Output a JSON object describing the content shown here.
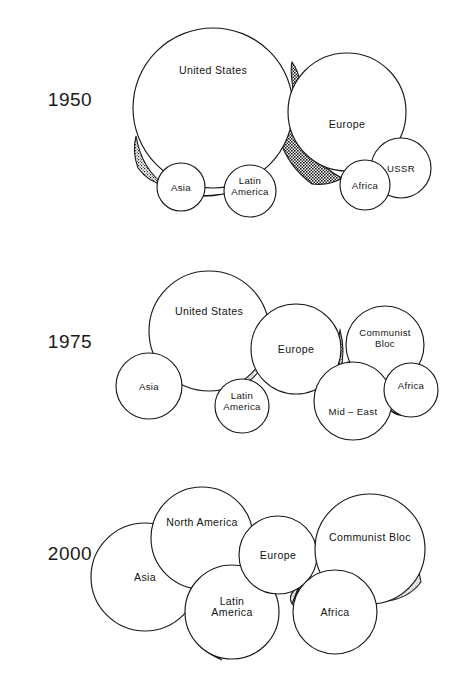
{
  "figure": {
    "background_color": "#ffffff",
    "line_color": "#1a1a1a",
    "shade_color": "#2b2b2b",
    "width": 470,
    "height": 683
  },
  "chart_data": {
    "type": "bubble",
    "xlabel": "",
    "ylabel": "",
    "legend_position": "none",
    "grid": false,
    "note": "Each panel is a year; circle area represents relative share of world power. Stippled lenses mark the gaps/overlaps between adjacent blocs.",
    "panels": [
      {
        "year": "1950",
        "year_x": 70,
        "year_y": 106,
        "bubbles": [
          {
            "label": "United States",
            "cx": 213,
            "cy": 108,
            "r": 80,
            "label_dy": -34,
            "size_class": "big"
          },
          {
            "label": "Europe",
            "cx": 347,
            "cy": 112,
            "r": 59,
            "label_dy": 16,
            "size_class": "big"
          },
          {
            "label": "USSR",
            "cx": 401,
            "cy": 168,
            "r": 30,
            "label_dy": 4,
            "size_class": "small"
          },
          {
            "label": "Asia",
            "cx": 181,
            "cy": 187,
            "r": 24,
            "label_dy": 4,
            "size_class": "small"
          },
          {
            "label": "Latin\nAmerica",
            "cx": 250,
            "cy": 191,
            "r": 26,
            "label_dy": -2,
            "size_class": "small"
          },
          {
            "label": "Africa",
            "cx": 365,
            "cy": 185,
            "r": 25,
            "label_dy": 4,
            "size_class": "small"
          }
        ],
        "shades": [
          {
            "tone": "dark",
            "path": "M 292 62 Q 306 82 297 108 Q 289 74 292 62 Z"
          },
          {
            "tone": "dark",
            "path": "M 296 118 Q 306 160 342 178 Q 330 186 312 184 Q 288 166 280 140 Q 290 128 296 118 Z"
          },
          {
            "tone": "medium",
            "path": "M 136 136 Q 142 170 166 186 Q 148 182 138 168 Q 132 152 136 136 Z"
          },
          {
            "tone": "medium",
            "path": "M 166 190 Q 196 200 224 194 Q 196 198 172 193 Z"
          },
          {
            "tone": "medium",
            "path": "M 374 176 Q 388 186 392 196 Q 380 192 373 182 Z"
          }
        ]
      },
      {
        "year": "1975",
        "year_x": 70,
        "year_y": 348,
        "bubbles": [
          {
            "label": "United States",
            "cx": 209,
            "cy": 331,
            "r": 60,
            "label_dy": -16,
            "size_class": "big"
          },
          {
            "label": "Europe",
            "cx": 296,
            "cy": 349,
            "r": 45,
            "label_dy": 4,
            "size_class": "big"
          },
          {
            "label": "Communist\nBloc",
            "cx": 385,
            "cy": 345,
            "r": 39,
            "label_dy": -4,
            "size_class": "small"
          },
          {
            "label": "Asia",
            "cx": 149,
            "cy": 386,
            "r": 33,
            "label_dy": 4,
            "size_class": "small"
          },
          {
            "label": "Latin\nAmerica",
            "cx": 242,
            "cy": 406,
            "r": 27,
            "label_dy": -2,
            "size_class": "small"
          },
          {
            "label": "Mid – East",
            "cx": 353,
            "cy": 401,
            "r": 39,
            "label_dy": 14,
            "size_class": "small"
          },
          {
            "label": "Africa",
            "cx": 411,
            "cy": 390,
            "r": 27,
            "label_dy": -1,
            "size_class": "small"
          }
        ],
        "shades": [
          {
            "tone": "medium",
            "path": "M 181 378 Q 210 392 238 384 Q 212 396 186 386 Z"
          },
          {
            "tone": "light",
            "path": "M 258 372 Q 248 386 240 380 Q 252 372 258 366 Z"
          },
          {
            "tone": "light",
            "path": "M 253 316 Q 262 340 258 366 Q 250 342 253 316 Z"
          },
          {
            "tone": "medium",
            "path": "M 340 330 Q 346 352 340 372 Q 335 350 340 330 Z"
          },
          {
            "tone": "medium",
            "path": "M 348 362 Q 368 376 386 374 Q 362 382 346 370 Z"
          },
          {
            "tone": "medium",
            "path": "M 419 362 Q 409 374 390 374 Q 408 368 419 358 Z"
          },
          {
            "tone": "medium",
            "path": "M 388 408 Q 398 418 404 414 Q 392 414 386 406 Z"
          }
        ]
      },
      {
        "year": "2000",
        "year_x": 70,
        "year_y": 560,
        "bubbles": [
          {
            "label": "Asia",
            "cx": 145,
            "cy": 577,
            "r": 54,
            "label_dy": 4,
            "size_class": "big"
          },
          {
            "label": "North America",
            "cx": 202,
            "cy": 538,
            "r": 51,
            "label_dy": -12,
            "size_class": "big"
          },
          {
            "label": "Latin\nAmerica",
            "cx": 232,
            "cy": 612,
            "r": 47,
            "label_dy": -2,
            "size_class": "big"
          },
          {
            "label": "Europe",
            "cx": 278,
            "cy": 555,
            "r": 39,
            "label_dy": 4,
            "size_class": "big"
          },
          {
            "label": "Communist Bloc",
            "cx": 370,
            "cy": 549,
            "r": 55,
            "label_dy": -8,
            "size_class": "big"
          },
          {
            "label": "Africa",
            "cx": 335,
            "cy": 612,
            "r": 42,
            "label_dy": 4,
            "size_class": "big"
          }
        ],
        "shades": [
          {
            "tone": "dark",
            "path": "M 196 552 Q 186 578 196 596 Q 228 606 244 592 Q 236 572 240 552 Q 216 562 196 552 Z"
          },
          {
            "tone": "light",
            "path": "M 196 596 Q 190 614 196 634 Q 206 652 222 660 Q 198 650 188 628 Q 184 610 190 594 Z"
          },
          {
            "tone": "light",
            "path": "M 240 552 Q 250 562 258 568 Q 246 562 240 556 Z"
          },
          {
            "tone": "light",
            "path": "M 296 588 Q 286 598 294 606 Q 304 592 300 582 Z"
          },
          {
            "tone": "light",
            "path": "M 306 574 Q 298 590 292 604 Q 300 584 304 570 Z"
          },
          {
            "tone": "light",
            "path": "M 419 572 Q 406 594 380 602 Q 408 600 421 582 Z"
          }
        ]
      }
    ]
  }
}
